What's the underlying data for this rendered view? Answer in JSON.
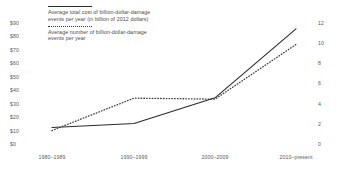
{
  "chart_data": {
    "type": "line",
    "title": "",
    "subtitle": "",
    "xlabel": "",
    "categories": [
      "1980–1989",
      "1990–1999",
      "2000–2009",
      "2010–present"
    ],
    "grid": false,
    "legend_position": "top-left",
    "axes": {
      "left": {
        "label": "",
        "ticks": [
          "$0",
          "$10",
          "$20",
          "$30",
          "$40",
          "$50",
          "$60",
          "$70",
          "$80",
          "$90"
        ],
        "tick_values": [
          0,
          10,
          20,
          30,
          40,
          50,
          60,
          70,
          80,
          90
        ],
        "min": 0,
        "max": 90
      },
      "right": {
        "label": "",
        "ticks": [
          "0",
          "2",
          "4",
          "6",
          "8",
          "10",
          "12"
        ],
        "tick_values": [
          0,
          2,
          4,
          6,
          8,
          10,
          12
        ],
        "min": 0,
        "max": 12
      }
    },
    "series": [
      {
        "name": "Average total cost of billion-dollar-damage events per year (in billion of 2012 dollars)",
        "axis": "left",
        "style": "solid",
        "color": "#2b2b2b",
        "values": [
          12,
          15,
          34,
          85
        ]
      },
      {
        "name": "Average number of billion-dollar-damage events per year",
        "axis": "right",
        "style": "dotted",
        "color": "#3a3a3a",
        "values": [
          1.3,
          4.5,
          4.4,
          9.8
        ]
      }
    ]
  },
  "legend": {
    "entries": [
      {
        "swatch": "solid-line-swatch",
        "text": "Average total cost of billion-dollar-damage events per year (in billion of 2012 dollars)"
      },
      {
        "swatch": "dotted-line-swatch",
        "text": "Average number of billion-dollar-damage events per year"
      }
    ]
  }
}
